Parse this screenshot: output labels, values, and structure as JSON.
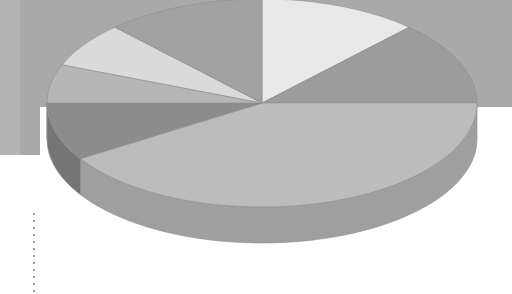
{
  "canvas": {
    "width": 512,
    "height": 294
  },
  "background": {
    "name": "slide-background",
    "upper_band_color": "#a9a9a9",
    "upper_band_left_strip_color": "#b4b4b4",
    "left_strip_width": 20,
    "lower_color": "#ffffff",
    "left_band_bottom_y": 155,
    "right_band_bottom_y": 107
  },
  "guide": {
    "name": "dotted-guide-line",
    "color": "#9b9b9b",
    "x": 33,
    "y_start": 213,
    "y_end": 294,
    "dot_size": 2,
    "dot_gap": 7
  },
  "chart_data": {
    "type": "pie",
    "title": "",
    "subtitle": "",
    "xlabel": "",
    "ylabel": "",
    "legend": "none",
    "grid": false,
    "three_d": true,
    "cropped": true,
    "geometry": {
      "center_x": 262,
      "center_y": 103,
      "radius_x": 215,
      "radius_y": 104,
      "depth": 36,
      "start_angle_deg": -90,
      "direction": "clockwise"
    },
    "categories": [
      "Slice 1",
      "Slice 2",
      "Slice 3",
      "Slice 4",
      "Slice 5",
      "Slice 6",
      "Slice 7"
    ],
    "values": [
      12,
      13,
      41,
      9,
      6,
      7,
      12
    ],
    "percentages": [
      12,
      13,
      41,
      9,
      6,
      7,
      12
    ],
    "colors": [
      "#e9e9e9",
      "#9c9c9c",
      "#bcbcbc",
      "#8c8c8c",
      "#b6b6b6",
      "#dadada",
      "#a2a2a2"
    ],
    "side_colors": [
      "#c2c2c2",
      "#848484",
      "#9f9f9f",
      "#757575",
      "#999999",
      "#b7b7b7",
      "#8a8a8a"
    ],
    "edge_color": "#8f8f8f"
  }
}
